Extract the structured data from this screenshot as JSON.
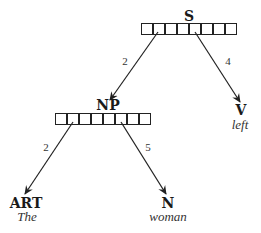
{
  "diagram": {
    "type": "parse-tree",
    "nodes": {
      "s": {
        "label": "S",
        "boxes": 8
      },
      "np": {
        "label": "NP",
        "boxes": 8
      },
      "v": {
        "label": "V",
        "word": "left"
      },
      "art": {
        "label": "ART",
        "word": "The"
      },
      "n": {
        "label": "N",
        "word": "woman"
      }
    },
    "edges": {
      "s_np": {
        "from": "S",
        "to": "NP",
        "label": "2"
      },
      "s_v": {
        "from": "S",
        "to": "V",
        "label": "4"
      },
      "np_art": {
        "from": "NP",
        "to": "ART",
        "label": "2"
      },
      "np_n": {
        "from": "NP",
        "to": "N",
        "label": "5"
      }
    },
    "colors": {
      "line": "#222222",
      "text": "#1a1a1a",
      "background": "#ffffff"
    }
  }
}
